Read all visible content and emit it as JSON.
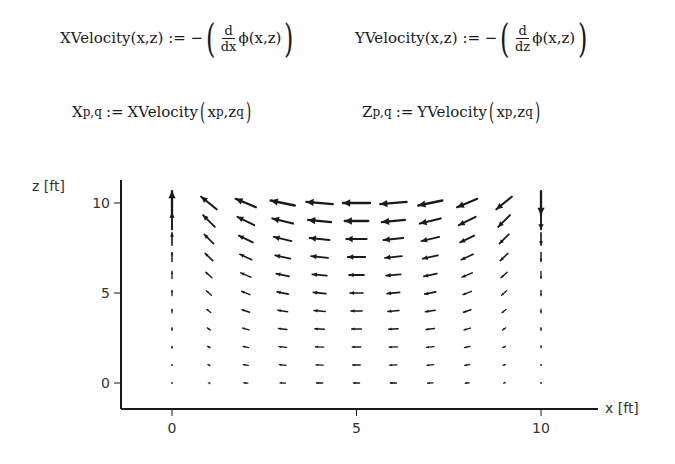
{
  "equations": {
    "xvel": {
      "lhs": "XVelocity(x,z)",
      "assign": ":=",
      "minus": "−",
      "num": "d",
      "den": "dx",
      "func": "ϕ(x,z)"
    },
    "yvel": {
      "lhs": "YVelocity(x,z)",
      "assign": ":=",
      "minus": "−",
      "num": "d",
      "den": "dz",
      "func": "ϕ(x,z)"
    },
    "xgrid": {
      "var": "X",
      "sub": "p,q",
      "assign": ":=",
      "rhs_func": "XVelocity",
      "arg1": "x",
      "arg1_sub": "p",
      "arg2": "z",
      "arg2_sub": "q"
    },
    "zgrid": {
      "var": "Z",
      "sub": "p,q",
      "assign": ":=",
      "rhs_func": "YVelocity",
      "arg1": "x",
      "arg1_sub": "p",
      "arg2": "z",
      "arg2_sub": "q"
    }
  },
  "chart_data": {
    "type": "quiver",
    "title": "",
    "xlabel": "x [ft]",
    "ylabel": "z [ft]",
    "xticks": [
      0,
      5,
      10
    ],
    "yticks": [
      0,
      5,
      10
    ],
    "xlim": [
      -1.4,
      11.6
    ],
    "ylim": [
      -1.4,
      11.2
    ],
    "grid": false,
    "x": [
      0,
      1,
      2,
      3,
      4,
      5,
      6,
      7,
      8,
      9,
      10
    ],
    "z": [
      0,
      1,
      2,
      3,
      4,
      5,
      6,
      7,
      8,
      9,
      10
    ],
    "arrows_note": "u = horizontal component (negative = left), w = vertical component; estimated relative lengths in data units",
    "u": [
      [
        0,
        -0.05,
        -0.15,
        -0.2,
        -0.22,
        -0.22,
        -0.22,
        -0.2,
        -0.15,
        -0.05,
        0
      ],
      [
        0,
        -0.08,
        -0.18,
        -0.24,
        -0.26,
        -0.27,
        -0.26,
        -0.24,
        -0.18,
        -0.08,
        0
      ],
      [
        0,
        -0.1,
        -0.2,
        -0.27,
        -0.3,
        -0.3,
        -0.3,
        -0.27,
        -0.2,
        -0.1,
        0
      ],
      [
        0,
        -0.12,
        -0.23,
        -0.3,
        -0.34,
        -0.35,
        -0.34,
        -0.3,
        -0.23,
        -0.12,
        0
      ],
      [
        0,
        -0.15,
        -0.27,
        -0.35,
        -0.4,
        -0.4,
        -0.4,
        -0.35,
        -0.27,
        -0.15,
        0
      ],
      [
        0,
        -0.18,
        -0.3,
        -0.4,
        -0.45,
        -0.46,
        -0.45,
        -0.4,
        -0.3,
        -0.18,
        0
      ],
      [
        0,
        -0.22,
        -0.36,
        -0.46,
        -0.52,
        -0.53,
        -0.52,
        -0.46,
        -0.36,
        -0.22,
        0
      ],
      [
        0,
        -0.27,
        -0.42,
        -0.54,
        -0.6,
        -0.62,
        -0.6,
        -0.54,
        -0.42,
        -0.27,
        0
      ],
      [
        0,
        -0.33,
        -0.5,
        -0.63,
        -0.7,
        -0.72,
        -0.7,
        -0.63,
        -0.5,
        -0.33,
        0
      ],
      [
        0,
        -0.42,
        -0.6,
        -0.74,
        -0.82,
        -0.84,
        -0.82,
        -0.74,
        -0.6,
        -0.42,
        0
      ],
      [
        0,
        -0.55,
        -0.72,
        -0.86,
        -0.94,
        -0.96,
        -0.94,
        -0.86,
        -0.72,
        -0.55,
        0
      ]
    ],
    "w": [
      [
        0.02,
        0.02,
        0.01,
        0.01,
        0,
        0,
        0,
        -0.01,
        -0.01,
        -0.02,
        -0.02
      ],
      [
        0.04,
        0.04,
        0.03,
        0.02,
        0.01,
        0,
        -0.01,
        -0.02,
        -0.03,
        -0.04,
        -0.04
      ],
      [
        0.07,
        0.06,
        0.05,
        0.03,
        0.01,
        0,
        -0.01,
        -0.03,
        -0.05,
        -0.06,
        -0.07
      ],
      [
        0.1,
        0.09,
        0.07,
        0.04,
        0.02,
        0,
        -0.02,
        -0.04,
        -0.07,
        -0.09,
        -0.1
      ],
      [
        0.14,
        0.12,
        0.09,
        0.06,
        0.03,
        0,
        -0.03,
        -0.06,
        -0.09,
        -0.12,
        -0.14
      ],
      [
        0.19,
        0.16,
        0.12,
        0.08,
        0.04,
        0,
        -0.04,
        -0.08,
        -0.12,
        -0.16,
        -0.19
      ],
      [
        0.25,
        0.2,
        0.15,
        0.1,
        0.05,
        0,
        -0.05,
        -0.1,
        -0.15,
        -0.2,
        -0.25
      ],
      [
        0.33,
        0.26,
        0.19,
        0.12,
        0.06,
        0,
        -0.06,
        -0.12,
        -0.19,
        -0.26,
        -0.33
      ],
      [
        0.44,
        0.33,
        0.24,
        0.15,
        0.07,
        0,
        -0.07,
        -0.15,
        -0.24,
        -0.33,
        -0.44
      ],
      [
        0.6,
        0.42,
        0.3,
        0.18,
        0.08,
        0,
        -0.08,
        -0.18,
        -0.3,
        -0.42,
        -0.6
      ],
      [
        0.85,
        0.45,
        0.3,
        0.18,
        0.08,
        0,
        -0.08,
        -0.18,
        -0.3,
        -0.45,
        -0.85
      ]
    ]
  },
  "colors": {
    "ink": "#1a1a1a",
    "background": "#ffffff"
  }
}
